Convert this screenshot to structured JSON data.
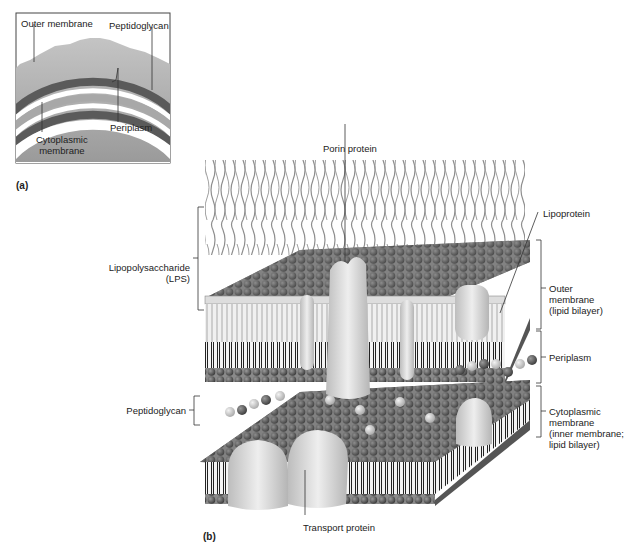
{
  "figure": {
    "panel_a": {
      "tag": "(a)",
      "labels": {
        "outer_membrane": "Outer membrane",
        "peptidoglycan": "Peptidoglycan",
        "periplasm": "Periplasm",
        "cytoplasmic_membrane_line1": "Cytoplasmic",
        "cytoplasmic_membrane_line2": "membrane"
      }
    },
    "panel_b": {
      "tag": "(b)",
      "labels": {
        "porin_protein": "Porin protein",
        "lipoprotein": "Lipoprotein",
        "lps_line1": "Lipopolysaccharide",
        "lps_line2": "(LPS)",
        "outer_membrane_line1": "Outer",
        "outer_membrane_line2": "membrane",
        "outer_membrane_line3": "(lipid bilayer)",
        "periplasm": "Periplasm",
        "peptidoglycan": "Peptidoglycan",
        "cytoplasmic_line1": "Cytoplasmic",
        "cytoplasmic_line2": "membrane",
        "cytoplasmic_line3": "(inner membrane;",
        "cytoplasmic_line4": "lipid bilayer)",
        "transport_protein": "Transport protein"
      }
    },
    "colors": {
      "outer_layer": "#b0b0b0",
      "dark_band": "#5a5a5a",
      "head_group": "#555555",
      "protein": "#d8d8d8",
      "lps_chain": "#8a8a8a"
    }
  }
}
